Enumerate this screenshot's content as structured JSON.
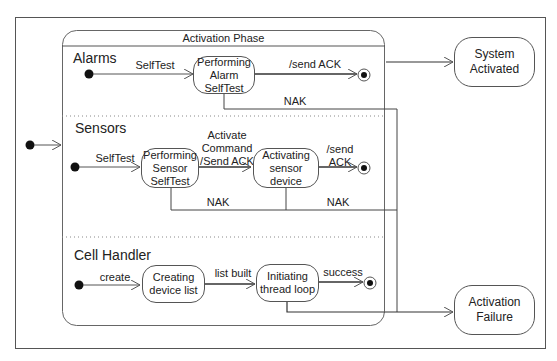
{
  "diagram": {
    "type": "UML state machine",
    "composite_state": {
      "title": "Activation Phase",
      "regions": [
        {
          "name": "Alarms",
          "initial_transition": "SelfTest",
          "states": [
            "Performing\nAlarm\nSelfTest"
          ],
          "transitions": [
            {
              "from": "initial",
              "to": "Performing Alarm SelfTest",
              "label": "SelfTest"
            },
            {
              "from": "Performing Alarm SelfTest",
              "to": "final",
              "label": "/send ACK"
            },
            {
              "from": "Performing Alarm SelfTest",
              "to": "Activation Failure",
              "label": "NAK"
            }
          ]
        },
        {
          "name": "Sensors",
          "states": [
            "Performing\nSensor\nSelfTest",
            "Activating\nsensor\ndevice"
          ],
          "transitions": [
            {
              "from": "initial",
              "to": "Performing Sensor SelfTest",
              "label": "SelfTest"
            },
            {
              "from": "Performing Sensor SelfTest",
              "to": "Activating sensor device",
              "label": "Activate\nCommand\n/Send ACK"
            },
            {
              "from": "Activating sensor device",
              "to": "final",
              "label": "/send\nACK"
            },
            {
              "from": "Performing Sensor SelfTest",
              "to": "Activation Failure",
              "label": "NAK"
            },
            {
              "from": "Activating sensor device",
              "to": "Activation Failure",
              "label": "NAK"
            }
          ]
        },
        {
          "name": "Cell Handler",
          "states": [
            "Creating\ndevice list",
            "Initiating\nthread loop"
          ],
          "transitions": [
            {
              "from": "initial",
              "to": "Creating device list",
              "label": "create"
            },
            {
              "from": "Creating device list",
              "to": "Initiating thread loop",
              "label": "list built"
            },
            {
              "from": "Initiating thread loop",
              "to": "final",
              "label": "success"
            },
            {
              "from": "Initiating thread loop",
              "to": "Activation Failure",
              "label": ""
            }
          ]
        }
      ]
    },
    "external_states": {
      "system_activated": "System\nActivated",
      "activation_failure": "Activation\nFailure"
    }
  },
  "labels": {
    "composite_title": "Activation Phase",
    "alarms_title": "Alarms",
    "sensors_title": "Sensors",
    "cell_title": "Cell Handler",
    "alarm_selftest": "SelfTest",
    "alarm_state": "Performing\nAlarm\nSelfTest",
    "alarm_send_ack": "/send ACK",
    "alarm_nak": "NAK",
    "sensor_selftest": "SelfTest",
    "sensor_state1": "Performing\nSensor\nSelfTest",
    "sensor_activate_cmd": "Activate\nCommand\n/Send ACK",
    "sensor_state2": "Activating\nsensor\ndevice",
    "sensor_send_ack": "/send\nACK",
    "sensor_nak1": "NAK",
    "sensor_nak2": "NAK",
    "cell_create": "create",
    "cell_state1": "Creating\ndevice list",
    "cell_list_built": "list built",
    "cell_state2": "Initiating\nthread loop",
    "cell_success": "success",
    "system_activated": "System\nActivated",
    "activation_failure": "Activation\nFailure"
  },
  "colors": {
    "line": "#444444",
    "text": "#222222",
    "background": "#ffffff"
  }
}
